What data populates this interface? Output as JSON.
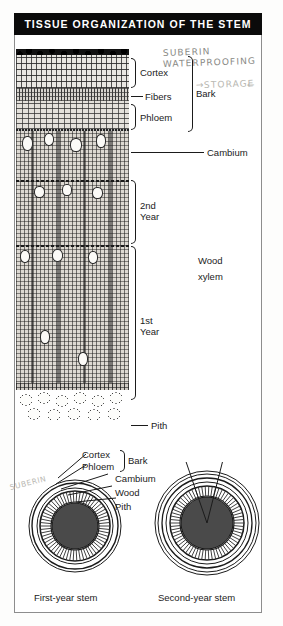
{
  "figure": {
    "title": "TISSUE ORGANIZATION OF THE STEM"
  },
  "longitudinal_labels": {
    "cortex": "Cortex",
    "fibers": "Fibers",
    "phloem": "Phloem",
    "bark": "Bark",
    "cambium": "Cambium",
    "second_year": "2nd",
    "second_year_b": "Year",
    "first_year": "1st",
    "first_year_b": "Year",
    "wood": "Wood",
    "xylem": "xylem",
    "pith": "Pith"
  },
  "cross_section_labels": {
    "cortex": "Cortex",
    "phloem": "Phloem",
    "bark": "Bark",
    "cambium": "Cambium",
    "wood": "Wood",
    "pith": "Pith"
  },
  "captions": {
    "first_year_stem": "First-year stem",
    "second_year_stem": "Second-year stem"
  },
  "annotations": {
    "suberin": "SUBERIN",
    "waterproofing": "WATERPROOFING",
    "storage": "STORAGE",
    "storage_arrow_left": "→",
    "storage_arrow_right": "←",
    "suberin_lower": "SUBERIN"
  },
  "colors": {
    "title_bar_background": "#0b0b0b",
    "title_text": "#ffffff",
    "ink": "#1b1b1b",
    "pencil": "#8a8a86",
    "paper": "#ffffff",
    "frame": "#8d8d8d"
  }
}
